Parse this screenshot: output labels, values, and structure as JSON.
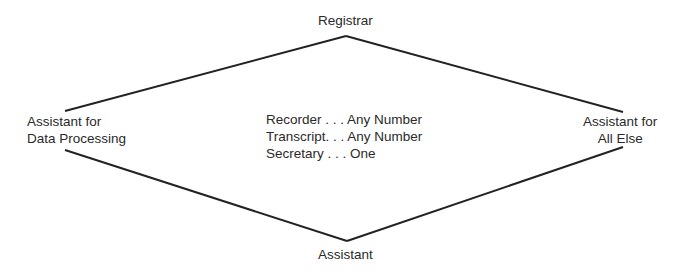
{
  "diagram": {
    "top": {
      "label": "Registrar"
    },
    "left": {
      "line1": "Assistant for",
      "line2": "Data Processing"
    },
    "right": {
      "line1": "Assistant for",
      "line2": "All Else"
    },
    "bottom": {
      "label": "Assistant"
    },
    "center": {
      "items": [
        {
          "text": "Recorder . . . Any Number"
        },
        {
          "text": "Transcript. . . Any Number"
        },
        {
          "text": "Secretary . . . One"
        }
      ]
    },
    "colors": {
      "line": "#222222",
      "text": "#2a2a2a",
      "background": "#ffffff"
    }
  }
}
